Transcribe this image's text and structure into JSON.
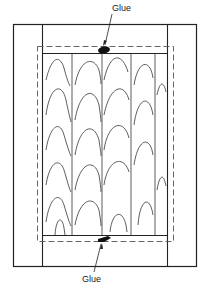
{
  "diagram": {
    "type": "frame-and-panel door construction",
    "labels": {
      "top_glue": "Glue",
      "bottom_glue": "Glue"
    },
    "colors": {
      "line": "#222222",
      "dashed": "#555555",
      "glue": "#111111",
      "background": "#ffffff"
    },
    "components": [
      "outer-frame",
      "left-stile",
      "right-stile",
      "top-rail",
      "bottom-rail",
      "panel-groove-dashed-outline",
      "solid-wood-panel-boards",
      "top-glue-spot",
      "bottom-glue-spot"
    ]
  }
}
